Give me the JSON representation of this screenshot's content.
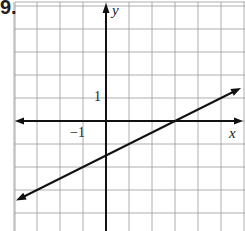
{
  "problem": {
    "number_label": "9."
  },
  "axes": {
    "x_label": "x",
    "y_label": "y",
    "tick_labels": {
      "y_one": "1",
      "x_neg_one": "−1"
    }
  },
  "grid": {
    "origin_px": [
      106,
      121
    ],
    "unit_px": 23,
    "x_range": [
      -4,
      6
    ],
    "y_range": [
      -5,
      5
    ],
    "grid_color": "#9a9a9a",
    "axis_color": "#111111"
  },
  "chart_data": {
    "type": "line",
    "title": "",
    "xlabel": "x",
    "ylabel": "y",
    "grid": true,
    "xlim": [
      -4,
      6
    ],
    "ylim": [
      -5,
      5
    ],
    "series": [
      {
        "name": "line",
        "equation": "y = 0.5x - 1.5",
        "slope": 0.5,
        "y_intercept": -1.5,
        "x_intercept": 3,
        "points": [
          [
            -4,
            -3.5
          ],
          [
            0,
            -1.5
          ],
          [
            3,
            0
          ],
          [
            5.8,
            1.4
          ]
        ]
      }
    ]
  }
}
